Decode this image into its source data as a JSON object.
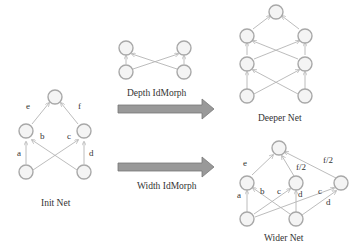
{
  "diagram": {
    "init_net": {
      "caption": "Init Net",
      "edge_labels": {
        "a": "a",
        "b": "b",
        "c": "c",
        "d": "d",
        "e": "e",
        "f": "f"
      }
    },
    "depth_idmorph": {
      "caption": "Depth IdMorph"
    },
    "deeper_net": {
      "caption": "Deeper Net"
    },
    "width_idmorph": {
      "caption": "Width IdMorph"
    },
    "wider_net": {
      "caption": "Wider Net",
      "edge_labels": {
        "a": "a",
        "b": "b",
        "c1": "c",
        "d1": "d",
        "c2": "c",
        "d2": "d",
        "e": "e",
        "f2a": "f/2",
        "f2b": "f/2"
      }
    },
    "colors": {
      "node_stroke": "#a8a8a8",
      "node_fill": "#f4f4f4",
      "edge": "#b4b4b4",
      "arrow": "#999999"
    }
  }
}
